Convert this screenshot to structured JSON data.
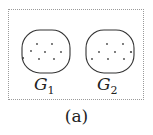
{
  "figure": {
    "caption": "(a)",
    "graphs": [
      {
        "name": "G",
        "subscript": "1",
        "vertex_count": 8
      },
      {
        "name": "G",
        "subscript": "2",
        "vertex_count": 8
      }
    ]
  }
}
